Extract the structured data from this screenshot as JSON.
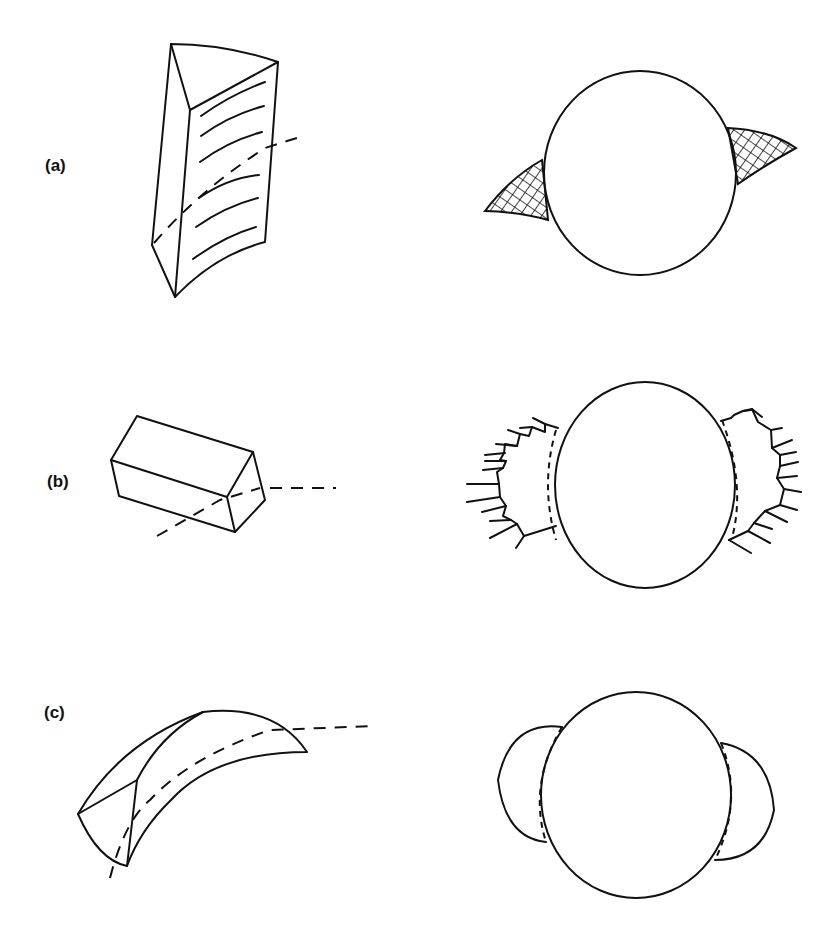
{
  "figure": {
    "panels": [
      {
        "id": "a",
        "label": "(a)",
        "left_shape": "curved triangular prism with striated face",
        "right_shape": "sphere with two cross-hatched wing projections"
      },
      {
        "id": "b",
        "label": "(b)",
        "left_shape": "rectangular box crossed by dashed axis",
        "right_shape": "sphere with comb-like stepped side projections"
      },
      {
        "id": "c",
        "label": "(c)",
        "left_shape": "curved horn-shaped wedge with dashed axis",
        "right_shape": "sphere with two hemispherical side lobes"
      }
    ],
    "colors": {
      "line": "#111111",
      "background": "#ffffff"
    }
  }
}
